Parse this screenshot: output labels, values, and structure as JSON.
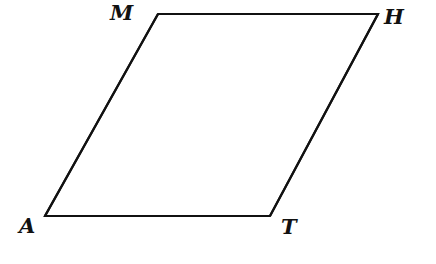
{
  "diagram": {
    "type": "parallelogram",
    "stroke_color": "#111111",
    "background": "#ffffff",
    "vertices": [
      {
        "label": "M",
        "x": 158,
        "y": 14,
        "label_x": 110,
        "label_y": 22
      },
      {
        "label": "H",
        "x": 378,
        "y": 14,
        "label_x": 383,
        "label_y": 25
      },
      {
        "label": "T",
        "x": 270,
        "y": 216,
        "label_x": 280,
        "label_y": 259
      },
      {
        "label": "A",
        "x": 45,
        "y": 216,
        "label_x": 18,
        "label_y": 232
      }
    ],
    "edges": [
      {
        "from": "M",
        "to": "H"
      },
      {
        "from": "H",
        "to": "T"
      },
      {
        "from": "T",
        "to": "A"
      },
      {
        "from": "A",
        "to": "M"
      }
    ],
    "labels": {
      "M": "M",
      "H": "H",
      "A": "A",
      "T": "T"
    }
  }
}
